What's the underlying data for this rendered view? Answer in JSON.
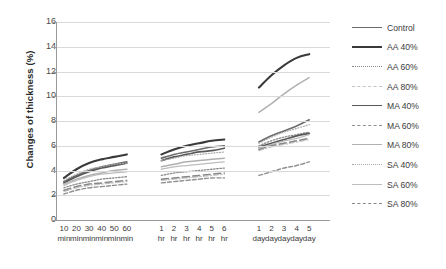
{
  "chart_data": {
    "type": "line",
    "title": "",
    "xlabel": "",
    "ylabel": "Changes of thickness (%)",
    "ylim": [
      0,
      16
    ],
    "ytick_values": [
      0,
      2,
      4,
      6,
      8,
      10,
      12,
      14,
      16
    ],
    "grid": "horizontal",
    "legend_position": "right",
    "x_groups": [
      {
        "name": "minutes",
        "ticks": [
          {
            "l1": "10",
            "l2": "min"
          },
          {
            "l1": "20",
            "l2": "min"
          },
          {
            "l1": "30",
            "l2": "min"
          },
          {
            "l1": "40",
            "l2": "min"
          },
          {
            "l1": "50",
            "l2": "min"
          },
          {
            "l1": "60",
            "l2": "min"
          }
        ]
      },
      {
        "name": "hours",
        "ticks": [
          {
            "l1": "1",
            "l2": "hr"
          },
          {
            "l1": "2",
            "l2": "hr"
          },
          {
            "l1": "3",
            "l2": "hr"
          },
          {
            "l1": "4",
            "l2": "hr"
          },
          {
            "l1": "5",
            "l2": "hr"
          },
          {
            "l1": "6",
            "l2": "hr"
          }
        ]
      },
      {
        "name": "days",
        "ticks": [
          {
            "l1": "1",
            "l2": "day"
          },
          {
            "l1": "2",
            "l2": "day"
          },
          {
            "l1": "3",
            "l2": "day"
          },
          {
            "l1": "4",
            "l2": "day"
          },
          {
            "l1": "5",
            "l2": "day"
          }
        ]
      }
    ],
    "series": [
      {
        "name": "Control",
        "color": "#6b6b6b",
        "dash": "none",
        "width": 1.6,
        "minutes": [
          3.1,
          3.6,
          4.0,
          4.3,
          4.5,
          4.7
        ],
        "hours": [
          5.0,
          5.3,
          5.5,
          5.7,
          5.9,
          6.0
        ],
        "days": [
          6.3,
          6.8,
          7.2,
          7.6,
          8.1
        ]
      },
      {
        "name": "AA 40%",
        "color": "#3a3a3a",
        "dash": "none",
        "width": 2.1,
        "minutes": [
          3.4,
          4.1,
          4.6,
          4.9,
          5.1,
          5.3
        ],
        "hours": [
          5.3,
          5.7,
          6.0,
          6.2,
          6.4,
          6.5
        ],
        "days": [
          10.7,
          11.7,
          12.5,
          13.1,
          13.4
        ]
      },
      {
        "name": "AA 60%",
        "color": "#8a8a8a",
        "dash": "dotted",
        "width": 1.3,
        "minutes": [
          2.6,
          2.9,
          3.1,
          3.3,
          3.4,
          3.5
        ],
        "hours": [
          3.6,
          3.8,
          3.9,
          4.0,
          4.1,
          4.2
        ],
        "days": [
          6.0,
          6.4,
          6.7,
          6.9,
          7.1
        ]
      },
      {
        "name": "AA 80%",
        "color": "#c4c4c4",
        "dash": "dashdot",
        "width": 1.2,
        "minutes": [
          2.3,
          2.6,
          2.8,
          2.9,
          3.0,
          3.1
        ],
        "hours": [
          3.2,
          3.3,
          3.4,
          3.5,
          3.6,
          3.7
        ],
        "days": [
          5.6,
          5.9,
          6.1,
          6.3,
          6.5
        ]
      },
      {
        "name": "MA 40%",
        "color": "#595959",
        "dash": "none",
        "width": 1.7,
        "minutes": [
          3.0,
          3.5,
          3.9,
          4.2,
          4.4,
          4.6
        ],
        "hours": [
          4.8,
          5.1,
          5.3,
          5.5,
          5.6,
          5.8
        ],
        "days": [
          5.9,
          6.2,
          6.5,
          6.8,
          7.0
        ]
      },
      {
        "name": "MA 60%",
        "color": "#8f8f8f",
        "dash": "dashed",
        "width": 1.4,
        "minutes": [
          2.1,
          2.4,
          2.6,
          2.7,
          2.8,
          2.9
        ],
        "hours": [
          3.0,
          3.1,
          3.2,
          3.3,
          3.4,
          3.4
        ],
        "days": [
          3.6,
          3.9,
          4.2,
          4.4,
          4.7
        ]
      },
      {
        "name": "MA 80%",
        "color": "#b0b0b0",
        "dash": "none",
        "width": 1.5,
        "minutes": [
          2.9,
          3.3,
          3.6,
          3.8,
          4.0,
          4.1
        ],
        "hours": [
          4.3,
          4.5,
          4.7,
          4.8,
          4.9,
          5.0
        ],
        "days": [
          8.7,
          9.4,
          10.2,
          10.9,
          11.5
        ]
      },
      {
        "name": "SA 40%",
        "color": "#a8a8a8",
        "dash": "fine-dotted",
        "width": 1.2,
        "minutes": [
          3.2,
          3.7,
          4.1,
          4.3,
          4.5,
          4.6
        ],
        "hours": [
          4.8,
          5.0,
          5.2,
          5.3,
          5.4,
          5.5
        ],
        "days": [
          6.2,
          6.7,
          7.1,
          7.4,
          7.7
        ]
      },
      {
        "name": "SA 60%",
        "color": "#bdbdbd",
        "dash": "none",
        "width": 1.3,
        "minutes": [
          2.8,
          3.2,
          3.5,
          3.7,
          3.8,
          3.9
        ],
        "hours": [
          4.1,
          4.3,
          4.4,
          4.5,
          4.6,
          4.7
        ],
        "days": [
          5.8,
          6.1,
          6.4,
          6.6,
          6.9
        ]
      },
      {
        "name": "SA 80%",
        "color": "#888888",
        "dash": "long-dash",
        "width": 1.5,
        "minutes": [
          2.4,
          2.7,
          2.9,
          3.0,
          3.1,
          3.2
        ],
        "hours": [
          3.3,
          3.4,
          3.5,
          3.6,
          3.7,
          3.8
        ],
        "days": [
          5.7,
          6.0,
          6.2,
          6.4,
          6.6
        ]
      }
    ]
  }
}
